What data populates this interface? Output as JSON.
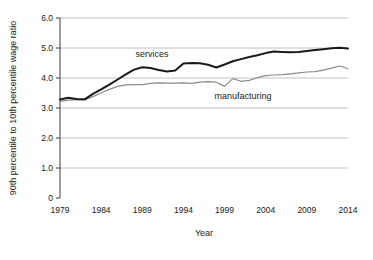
{
  "chart_data": {
    "type": "line",
    "title": "",
    "xlabel": "Year",
    "ylabel": "90th percentile to 10th percentile wage ratio",
    "xlim": [
      1979,
      2014
    ],
    "ylim": [
      0,
      6.0
    ],
    "grid": "horizontal",
    "legend_position": "inline-annotations",
    "x_ticks": [
      "1979",
      "1984",
      "1989",
      "1994",
      "1999",
      "2004",
      "2009",
      "2014"
    ],
    "x_tick_values": [
      1979,
      1984,
      1989,
      1994,
      1999,
      2004,
      2009,
      2014
    ],
    "y_ticks": [
      "0",
      "1.0",
      "2.0",
      "3.0",
      "4.0",
      "5.0",
      "6.0"
    ],
    "y_tick_values": [
      0,
      1.0,
      2.0,
      3.0,
      4.0,
      5.0,
      6.0
    ],
    "x": [
      1979,
      1980,
      1981,
      1982,
      1983,
      1984,
      1985,
      1986,
      1987,
      1988,
      1989,
      1990,
      1991,
      1992,
      1993,
      1994,
      1995,
      1996,
      1997,
      1998,
      1999,
      2000,
      2001,
      2002,
      2003,
      2004,
      2005,
      2006,
      2007,
      2008,
      2009,
      2010,
      2011,
      2012,
      2013,
      2014
    ],
    "series": [
      {
        "name": "services",
        "color": "#1a1a1a",
        "line_width": 2.0,
        "label_text": "services",
        "values": [
          3.28,
          3.34,
          3.3,
          3.29,
          3.47,
          3.62,
          3.78,
          3.95,
          4.12,
          4.28,
          4.36,
          4.33,
          4.27,
          4.22,
          4.25,
          4.48,
          4.5,
          4.49,
          4.44,
          4.35,
          4.45,
          4.56,
          4.63,
          4.7,
          4.76,
          4.83,
          4.88,
          4.87,
          4.86,
          4.87,
          4.9,
          4.93,
          4.96,
          4.99,
          5.01,
          4.98
        ]
      },
      {
        "name": "manufacturing",
        "color": "#8c8c8c",
        "line_width": 1.2,
        "label_text": "manufacturing",
        "values": [
          3.22,
          3.26,
          3.28,
          3.27,
          3.38,
          3.5,
          3.62,
          3.72,
          3.77,
          3.78,
          3.78,
          3.82,
          3.84,
          3.83,
          3.83,
          3.84,
          3.82,
          3.86,
          3.88,
          3.86,
          3.72,
          3.98,
          3.89,
          3.92,
          4.01,
          4.08,
          4.1,
          4.11,
          4.14,
          4.17,
          4.2,
          4.21,
          4.26,
          4.33,
          4.4,
          4.31
        ]
      }
    ],
    "annotations": [
      {
        "text": "services",
        "x_px": 152,
        "y_px": 57
      },
      {
        "text": "manufacturing",
        "x_px": 243,
        "y_px": 99
      }
    ]
  },
  "axes": {
    "plot_left_px": 60,
    "plot_right_px": 348,
    "plot_top_px": 18,
    "plot_bottom_px": 198,
    "grid_color": "#b0b0b0",
    "axis_color": "#4d4d4d"
  }
}
